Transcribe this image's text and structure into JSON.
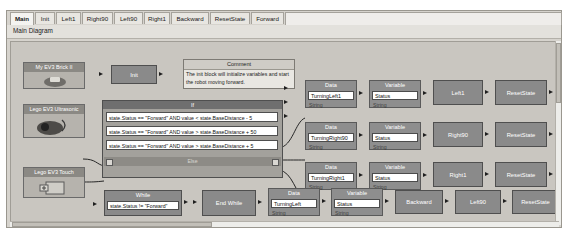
{
  "window": {
    "tabs": [
      {
        "label": "Main",
        "active": true
      },
      {
        "label": "Init",
        "active": false
      },
      {
        "label": "Left1",
        "active": false
      },
      {
        "label": "Right90",
        "active": false
      },
      {
        "label": "Left90",
        "active": false
      },
      {
        "label": "Right1",
        "active": false
      },
      {
        "label": "Backward",
        "active": false
      },
      {
        "label": "ResetState",
        "active": false
      },
      {
        "label": "Forward",
        "active": false
      }
    ],
    "subheader": "Main Diagram"
  },
  "devices": [
    {
      "name": "My EV3 Brick II",
      "icon": "ev3-brick-icon"
    },
    {
      "name": "Lego EV3 Ultrasonic",
      "icon": "ultrasonic-sensor-icon"
    },
    {
      "name": "Lego EV3 Touch",
      "icon": "touch-sensor-icon"
    }
  ],
  "init_block": {
    "label": "Init"
  },
  "comment": {
    "title": "Comment",
    "text": "The init block will initialize variables and start the robot moving forward."
  },
  "if_block": {
    "header": "If",
    "else_label": "Else",
    "conditions": [
      "state.Status == \"Forward\" AND value < state.BaseDistance - 5",
      "state.Status == \"Forward\" AND value > state.BaseDistance + 50",
      "state.Status == \"Forward\" AND value > state.BaseDistance + 5"
    ]
  },
  "data_blocks": [
    {
      "header": "Data",
      "value": "TurningLeft1",
      "type": "String"
    },
    {
      "header": "Data",
      "value": "TurningRight90",
      "type": "String"
    },
    {
      "header": "Data",
      "value": "TurningRight1",
      "type": "String"
    }
  ],
  "variable_blocks": [
    {
      "header": "Variable",
      "value": "Status",
      "type": "String"
    },
    {
      "header": "Variable",
      "value": "Status",
      "type": "String"
    },
    {
      "header": "Variable",
      "value": "Status",
      "type": "String"
    }
  ],
  "action_blocks": [
    {
      "label": "Left1"
    },
    {
      "label": "Right90"
    },
    {
      "label": "Right1"
    }
  ],
  "reset_blocks": [
    {
      "label": "ResetState"
    },
    {
      "label": "ResetState"
    },
    {
      "label": "ResetState"
    }
  ],
  "bottom_row": {
    "while": {
      "header": "While",
      "condition": "state.Status != \"Forward\""
    },
    "end_while": {
      "label": "End While"
    },
    "data": {
      "header": "Data",
      "value": "TurningLeft",
      "type": "String"
    },
    "variable": {
      "header": "Variable",
      "value": "Status",
      "type": "String"
    },
    "backward": {
      "label": "Backward"
    },
    "left90": {
      "label": "Left90"
    },
    "reset": {
      "label": "ResetState"
    }
  }
}
